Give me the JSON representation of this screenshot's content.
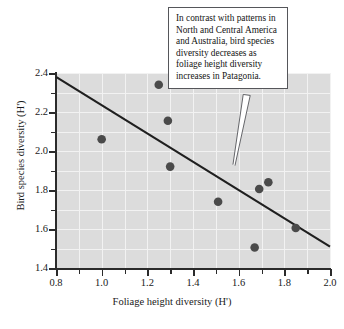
{
  "chart_data": {
    "type": "scatter",
    "title": "",
    "xlabel": "Foliage height diversity (H')",
    "ylabel": "Bird species diversity (H')",
    "xlim": [
      0.8,
      2.0
    ],
    "ylim": [
      1.4,
      2.4
    ],
    "xticks": [
      "0.8",
      "1.0",
      "1.2",
      "1.4",
      "1.6",
      "1.8",
      "2.0"
    ],
    "xtick_values": [
      0.8,
      1.0,
      1.2,
      1.4,
      1.6,
      1.8,
      2.0
    ],
    "xminor_values": [
      0.9,
      1.1,
      1.3,
      1.5,
      1.7,
      1.9
    ],
    "yticks": [
      "1.4",
      "1.6",
      "1.8",
      "2.0",
      "2.2",
      "2.4"
    ],
    "ytick_values": [
      1.4,
      1.6,
      1.8,
      2.0,
      2.2,
      2.4
    ],
    "yminor_values": [
      1.5,
      1.7,
      1.9,
      2.1,
      2.3
    ],
    "grid": true,
    "legend": "none",
    "plot_bg_color": "#dcdcdc",
    "grid_color": "#f2f2f2",
    "point_color": "#4a4a4a",
    "line_color": "#1f1f1f",
    "points": [
      {
        "x": 1.0,
        "y": 2.06
      },
      {
        "x": 1.25,
        "y": 2.34
      },
      {
        "x": 1.29,
        "y": 2.155
      },
      {
        "x": 1.3,
        "y": 1.92
      },
      {
        "x": 1.51,
        "y": 1.74
      },
      {
        "x": 1.67,
        "y": 1.505
      },
      {
        "x": 1.69,
        "y": 1.805
      },
      {
        "x": 1.73,
        "y": 1.84
      },
      {
        "x": 1.85,
        "y": 1.605
      }
    ],
    "trendline": {
      "x0": 0.8,
      "y0": 2.38,
      "x1": 2.0,
      "y1": 1.51
    },
    "annotations": [
      {
        "text": "In contrast with patterns in North and Central America and Australia, bird species diversity decreases as foliage height diversity increases in Patagonia.",
        "pointer_from": [
          1.575,
          1.93
        ],
        "pointer_to": [
          1.62,
          2.29
        ]
      }
    ]
  },
  "callout": {
    "text": "In contrast with patterns in North and Central America and Australia, bird species diversity decreases as foliage height diversity increases in Patagonia."
  }
}
